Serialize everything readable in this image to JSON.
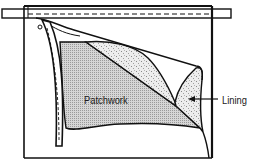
{
  "diagram": {
    "labels": {
      "patchwork": "Patchwork",
      "lining": "Lining"
    },
    "colors": {
      "line": "#111111",
      "background": "#ffffff",
      "patchwork_fill": "#c8c8c8",
      "lining_fill": "#e2e2e2"
    }
  }
}
